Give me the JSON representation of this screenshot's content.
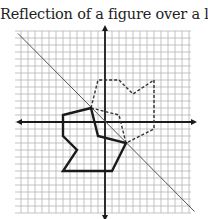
{
  "title": "Reflection of a figure over a line",
  "diagram": {
    "type": "coordinate-grid-reflection",
    "grid": {
      "x_range": [
        -12,
        12
      ],
      "y_range": [
        -13,
        13
      ],
      "cell_px": 7,
      "origin_px": [
        105,
        122
      ],
      "grid_color": "#b4b4b4",
      "axis_color": "#1a1a1a"
    },
    "line_of_reflection": {
      "equation": "y = -x",
      "from": [
        -12,
        12.5
      ],
      "to": [
        12.8,
        -12.8
      ],
      "color": "#555555"
    },
    "original_figure": {
      "style": "solid",
      "color": "#1a1a1a",
      "vertices": [
        [
          -2,
          2
        ],
        [
          -6,
          1
        ],
        [
          -6,
          -2
        ],
        [
          -4,
          -4
        ],
        [
          -6,
          -7
        ],
        [
          1,
          -7
        ],
        [
          3,
          -3
        ],
        [
          -1,
          -2
        ]
      ]
    },
    "reflected_figure": {
      "style": "dashed",
      "color": "#333333",
      "vertices": [
        [
          -2,
          2
        ],
        [
          -1,
          6
        ],
        [
          2,
          6
        ],
        [
          4,
          4
        ],
        [
          7,
          6
        ],
        [
          7,
          -1
        ],
        [
          3,
          -3
        ],
        [
          2,
          1
        ]
      ]
    }
  }
}
